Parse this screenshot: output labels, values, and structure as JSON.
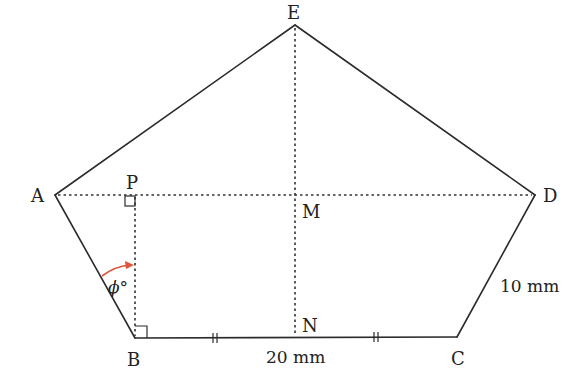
{
  "diagram": {
    "type": "geometry",
    "shape": "pentagon ABCDE",
    "colors": {
      "line": "#2b2b2b",
      "dotted": "#333333",
      "angle_arc": "#e0553a",
      "text": "#222222"
    },
    "points": {
      "A": {
        "label": "A",
        "x": 55,
        "y": 195
      },
      "B": {
        "label": "B",
        "x": 135,
        "y": 338
      },
      "C": {
        "label": "C",
        "x": 457,
        "y": 337
      },
      "D": {
        "label": "D",
        "x": 535,
        "y": 195
      },
      "E": {
        "label": "E",
        "x": 295,
        "y": 25
      },
      "P": {
        "label": "P",
        "x": 135,
        "y": 195
      },
      "M": {
        "label": "M",
        "x": 295,
        "y": 195
      },
      "N": {
        "label": "N",
        "x": 295,
        "y": 338
      }
    },
    "labels": {
      "A": "A",
      "B": "B",
      "C": "C",
      "D": "D",
      "E": "E",
      "P": "P",
      "M": "M",
      "N": "N",
      "angle": "ϕ°",
      "bc_length": "20 mm",
      "cd_length": "10 mm"
    },
    "solid_edges": [
      "AB",
      "BC",
      "CD",
      "DE",
      "EA"
    ],
    "dotted_segments": [
      "AD",
      "EN",
      "PB"
    ],
    "right_angles": [
      "P",
      "B"
    ],
    "equal_tick_marks": [
      "BN",
      "NC"
    ]
  }
}
